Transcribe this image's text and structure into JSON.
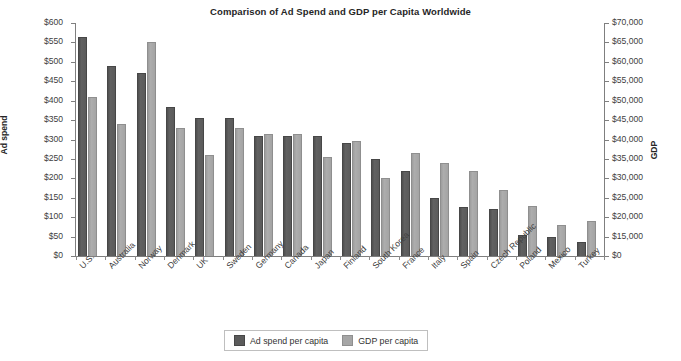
{
  "chart_data": {
    "type": "bar",
    "title": "Comparison of Ad Spend and GDP per Capita Worldwide",
    "xlabel": "",
    "ylabel": "Ad spend",
    "y2label": "GDP",
    "grid": false,
    "legend_position": "bottom",
    "categories": [
      "U.S.",
      "Australia",
      "Norway",
      "Denmark",
      "UK",
      "Sweden",
      "Germany",
      "Canada",
      "Japan",
      "Finland",
      "South Korea",
      "France",
      "Italy",
      "Spain",
      "Czech Republic",
      "Poland",
      "Mexico",
      "Turkey"
    ],
    "series": [
      {
        "name": "Ad spend per capita",
        "axis": "left",
        "color": "#5b5b5b",
        "values": [
          565,
          490,
          470,
          385,
          355,
          355,
          310,
          310,
          310,
          290,
          250,
          220,
          150,
          125,
          120,
          55,
          50,
          35
        ]
      },
      {
        "name": "GDP per capita",
        "axis": "right",
        "color": "#a6a6a6",
        "values": [
          51000,
          44000,
          65000,
          43000,
          36000,
          43000,
          41500,
          41500,
          35500,
          39500,
          30000,
          36500,
          34000,
          32000,
          27000,
          23000,
          18000,
          19000
        ]
      }
    ],
    "ylim": [
      0,
      600
    ],
    "ytick_labels": [
      "$600",
      "$550",
      "$500",
      "$450",
      "$400",
      "$350",
      "$300",
      "$250",
      "$200",
      "$150",
      "$100",
      "$50",
      "$0"
    ],
    "ytick_values": [
      600,
      550,
      500,
      450,
      400,
      350,
      300,
      250,
      200,
      150,
      100,
      50,
      0
    ],
    "y2lim": [
      0,
      70000
    ],
    "y2tick_labels": [
      "$70,000",
      "$65,000",
      "$60,000",
      "$55,000",
      "$50,000",
      "$45,000",
      "$40,000",
      "$35,000",
      "$30,000",
      "$25,000",
      "$20,000",
      "$15,000",
      "$0"
    ],
    "y2tick_values": [
      70000,
      65000,
      60000,
      55000,
      50000,
      45000,
      40000,
      35000,
      30000,
      25000,
      20000,
      15000,
      0
    ]
  }
}
